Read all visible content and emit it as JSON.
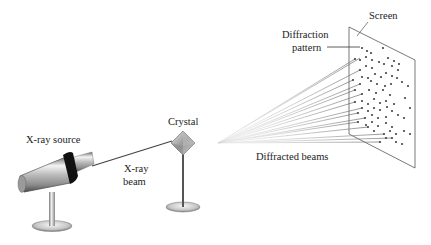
{
  "diagram": {
    "labels": {
      "screen": "Screen",
      "diffraction_pattern_line1": "Diffraction",
      "diffraction_pattern_line2": "pattern",
      "crystal": "Crystal",
      "xray_source": "X-ray source",
      "xray_beam_line1": "X-ray",
      "xray_beam_line2": "beam",
      "diffracted_beams": "Diffracted beams"
    },
    "components": [
      {
        "name": "X-ray source",
        "icon": "xray-tube-icon"
      },
      {
        "name": "Crystal",
        "icon": "crystal-octahedron-icon"
      },
      {
        "name": "Screen",
        "icon": "screen-plane-icon"
      }
    ],
    "colors": {
      "text": "#222222",
      "lines": "#555555",
      "metal_light": "#f0f0f0",
      "metal_dark": "#6a6a6a",
      "band": "#111111",
      "dots": "#444444"
    }
  }
}
